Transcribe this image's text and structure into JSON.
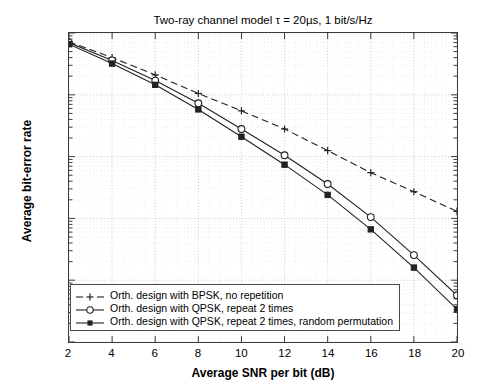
{
  "chart_data": {
    "type": "line",
    "title": "Two-ray channel model τ = 20µs, 1 bit/s/Hz",
    "xlabel": "Average SNR per bit (dB)",
    "ylabel": "Average bit-error rate",
    "x": [
      2,
      4,
      6,
      8,
      10,
      12,
      14,
      16,
      18,
      20
    ],
    "xlim": [
      2,
      20
    ],
    "ylim": [
      1e-06,
      0.1
    ],
    "yscale": "log",
    "grid": true,
    "legend_position": "lower left",
    "xticks": [
      "2",
      "4",
      "6",
      "8",
      "10",
      "12",
      "14",
      "16",
      "18",
      "20"
    ],
    "yticks": [
      {
        "label_base": "10",
        "label_exp": "-1",
        "value": 0.1
      },
      {
        "label_base": "10",
        "label_exp": "-2",
        "value": 0.01
      },
      {
        "label_base": "10",
        "label_exp": "-3",
        "value": 0.001
      },
      {
        "label_base": "10",
        "label_exp": "-4",
        "value": 0.0001
      },
      {
        "label_base": "10",
        "label_exp": "-5",
        "value": 1e-05
      },
      {
        "label_base": "10",
        "label_exp": "-6",
        "value": 1e-06
      }
    ],
    "series": [
      {
        "name": "Orth. design with BPSK, no repetition",
        "marker": "plus",
        "linestyle": "dashed",
        "color": "#222222",
        "values": [
          0.072,
          0.04,
          0.021,
          0.0105,
          0.0055,
          0.0028,
          0.00125,
          0.00055,
          0.00027,
          0.00013
        ]
      },
      {
        "name": "Orth. design with QPSK, repeat 2 times",
        "marker": "circle",
        "linestyle": "solid",
        "color": "#222222",
        "values": [
          0.07,
          0.036,
          0.017,
          0.0073,
          0.0028,
          0.00105,
          0.00036,
          0.000105,
          2.55e-05,
          5.7e-06
        ]
      },
      {
        "name": "Orth. design with QPSK, repeat 2 times, random permutation",
        "marker": "square-filled",
        "linestyle": "solid",
        "color": "#222222",
        "values": [
          0.066,
          0.032,
          0.0145,
          0.0058,
          0.0021,
          0.00074,
          0.00024,
          6.65e-05,
          1.6e-05,
          3.4e-06
        ]
      }
    ]
  }
}
